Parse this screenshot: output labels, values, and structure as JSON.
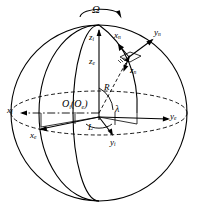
{
  "figure": {
    "background_color": "#ffffff",
    "line_color": "#000000"
  },
  "labels": {
    "omega": "Ω",
    "z_i": "z",
    "z_i_sub": "i",
    "z_e": "z",
    "z_e_sub": "e",
    "x_n": "x",
    "x_n_sub": "n",
    "y_n": "y",
    "y_n_sub": "n",
    "z_n": "z",
    "z_n_sub": "n",
    "radius": "R",
    "origin": "O",
    "origin_sub": "i",
    "origin_paren_open": "(O",
    "origin_paren_sub": "e",
    "origin_paren_close": ")",
    "lambda": "λ",
    "latitude": "L",
    "x_i": "x",
    "x_i_sub": "i",
    "x_e": "x",
    "x_e_sub": "e",
    "y_e": "y",
    "y_e_sub": "e",
    "y_i": "y",
    "y_i_sub": "i"
  },
  "geometry": {
    "sphere_center_x": 99,
    "sphere_center_y": 113,
    "sphere_radius": 88,
    "equator_ry": 22,
    "north_pole_x": 99,
    "north_pole_y": 25,
    "surface_point_x": 129,
    "surface_point_y": 57
  }
}
